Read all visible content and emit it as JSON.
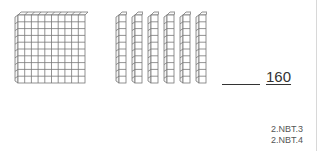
{
  "worksheet": {
    "hundreds_blocks": 1,
    "tens_rods": 6,
    "ones_cubes": 0,
    "answer_blank": "",
    "answer_value": "160",
    "standards": [
      "2.NBT.3",
      "2.NBT.4"
    ]
  },
  "colors": {
    "line": "#666666",
    "text": "#333333"
  }
}
